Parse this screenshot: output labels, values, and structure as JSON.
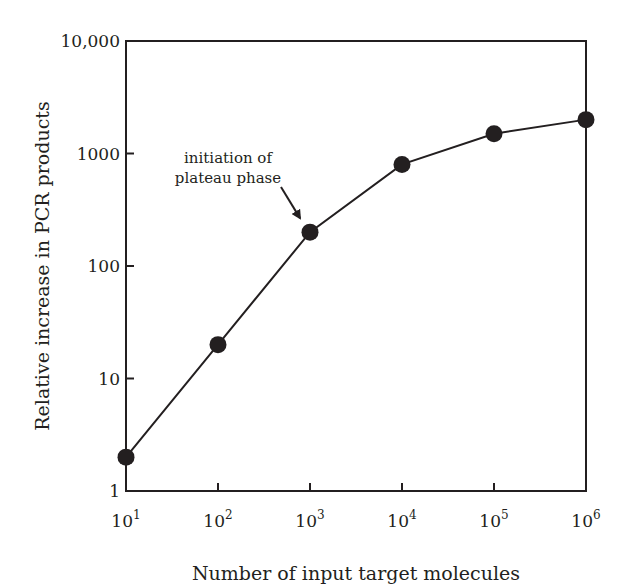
{
  "chart_data": {
    "type": "line",
    "title": "",
    "xlabel": "Number of input target molecules",
    "ylabel": "Relative increase in PCR products",
    "x_scale": "log",
    "y_scale": "log",
    "xlim": [
      10,
      1000000
    ],
    "ylim": [
      1,
      10000
    ],
    "grid": false,
    "legend": null,
    "x_ticks": [
      {
        "value": 10,
        "base": "10",
        "exp": "1"
      },
      {
        "value": 100,
        "base": "10",
        "exp": "2"
      },
      {
        "value": 1000,
        "base": "10",
        "exp": "3"
      },
      {
        "value": 10000,
        "base": "10",
        "exp": "4"
      },
      {
        "value": 100000,
        "base": "10",
        "exp": "5"
      },
      {
        "value": 1000000,
        "base": "10",
        "exp": "6"
      }
    ],
    "y_ticks": [
      {
        "value": 1,
        "label": "1"
      },
      {
        "value": 10,
        "label": "10"
      },
      {
        "value": 100,
        "label": "100"
      },
      {
        "value": 1000,
        "label": "1000"
      },
      {
        "value": 10000,
        "label": "10,000"
      }
    ],
    "series": [
      {
        "name": "PCR products",
        "marker": "filled-circle",
        "x": [
          10,
          100,
          1000,
          10000,
          100000,
          1000000
        ],
        "values": [
          2,
          20,
          200,
          800,
          1500,
          2000
        ]
      }
    ],
    "annotations": [
      {
        "text_lines": [
          "initiation of",
          "plateau phase"
        ],
        "points_to": {
          "x": 1000,
          "y": 200
        },
        "style": "arrow"
      }
    ]
  },
  "colors": {
    "ink": "#231f20",
    "background": "#ffffff"
  }
}
